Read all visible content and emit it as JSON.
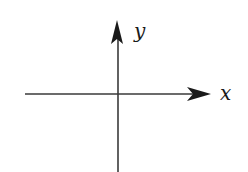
{
  "diagram": {
    "type": "coordinate-axes",
    "x_axis": {
      "label": "x"
    },
    "y_axis": {
      "label": "y"
    },
    "colors": {
      "line": "#3a3a3a",
      "arrow": "#1a1a1a",
      "background": "#ffffff"
    }
  }
}
